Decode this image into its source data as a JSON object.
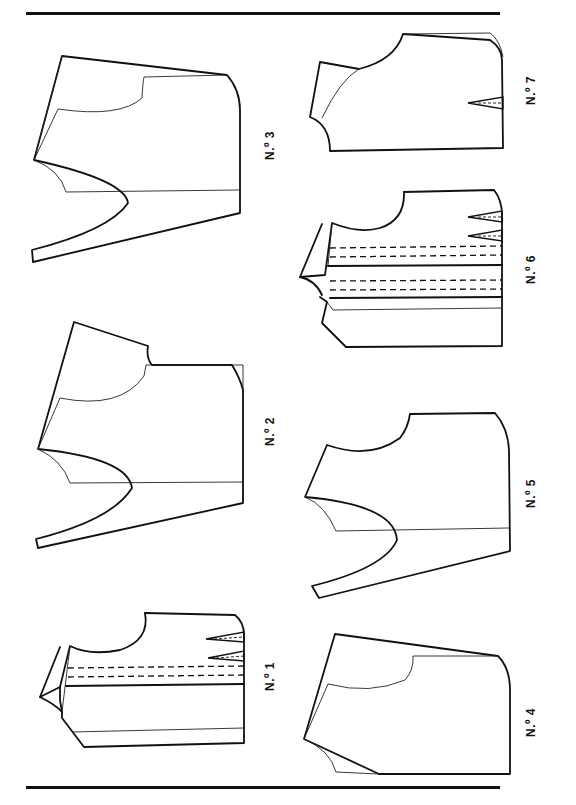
{
  "page": {
    "title": "",
    "orientation": "rotated-90",
    "rules": [
      "top-rule",
      "bottom-rule"
    ]
  },
  "figures": [
    {
      "id": 1,
      "label": "N.º 1",
      "description": "Bodice front with neckline facing, two waist darts and two dashed stitching lines"
    },
    {
      "id": 2,
      "label": "N.º 2",
      "description": "Bodice with deep curved armhole and shoulder notch"
    },
    {
      "id": 3,
      "label": "N.º 3",
      "description": "Bodice with deep curved armhole, wide shoulder slope"
    },
    {
      "id": 4,
      "label": "N.º 4",
      "description": "Bodice with angled side seam and neckline curve"
    },
    {
      "id": 5,
      "label": "N.º 5",
      "description": "Bodice with deep curved armhole and neckline"
    },
    {
      "id": 6,
      "label": "N.º 6",
      "description": "Bodice with facing, two waist darts, four dashed stitching lines and pleat"
    },
    {
      "id": 7,
      "label": "N.º 7",
      "description": "Bodice with collar band and single waist dart"
    }
  ],
  "colors": {
    "ink": "#111111",
    "paper": "#ffffff"
  }
}
